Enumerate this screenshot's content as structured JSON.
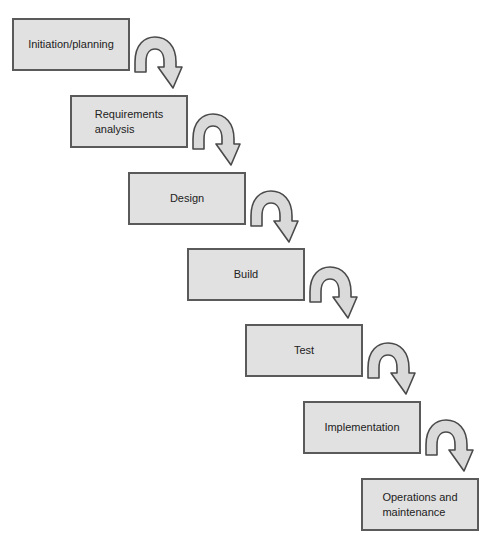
{
  "diagram": {
    "type": "waterfall-process",
    "stages": [
      {
        "label": "Initiation/planning"
      },
      {
        "label": "Requirements\nanalysis"
      },
      {
        "label": "Design"
      },
      {
        "label": "Build"
      },
      {
        "label": "Test"
      },
      {
        "label": "Implementation"
      },
      {
        "label": "Operations and\nmaintenance"
      }
    ],
    "connectors": [
      {
        "from": 0,
        "to": 1,
        "icon": "curved-down-arrow-icon"
      },
      {
        "from": 1,
        "to": 2,
        "icon": "curved-down-arrow-icon"
      },
      {
        "from": 2,
        "to": 3,
        "icon": "curved-down-arrow-icon"
      },
      {
        "from": 3,
        "to": 4,
        "icon": "curved-down-arrow-icon"
      },
      {
        "from": 4,
        "to": 5,
        "icon": "curved-down-arrow-icon"
      },
      {
        "from": 5,
        "to": 6,
        "icon": "curved-down-arrow-icon"
      }
    ],
    "colors": {
      "box_fill": "#e1e1e1",
      "box_border": "#5a5a5a",
      "arrow_fill": "#dadada",
      "arrow_stroke": "#4a4a4a",
      "text": "#222222"
    }
  }
}
